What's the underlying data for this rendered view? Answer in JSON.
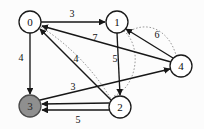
{
  "figure": {
    "type": "directed-weighted-graph",
    "background_color": "#fcfcfc",
    "node_fill_default": "#ffffff",
    "node_fill_highlight": "#8f8f8f",
    "edge_color": "#171717",
    "dotted_path_color": "#9a9a9a"
  },
  "nodes": [
    {
      "id": "0",
      "label": "0",
      "cx": 30,
      "cy": 22,
      "r": 11,
      "highlighted": false
    },
    {
      "id": "1",
      "label": "1",
      "cx": 117,
      "cy": 22,
      "r": 11,
      "highlighted": false
    },
    {
      "id": "4",
      "label": "4",
      "cx": 181,
      "cy": 66,
      "r": 11,
      "highlighted": false
    },
    {
      "id": "2",
      "label": "2",
      "cx": 120,
      "cy": 107,
      "r": 11,
      "highlighted": false
    },
    {
      "id": "3",
      "label": "3",
      "cx": 30,
      "cy": 106,
      "r": 11,
      "highlighted": true
    }
  ],
  "edges": [
    {
      "id": "e01",
      "from": "0",
      "to": "1",
      "weight": "3",
      "label_x": 72,
      "label_y": 13
    },
    {
      "id": "e40",
      "from": "4",
      "to": "0",
      "weight": "7",
      "label_x": 95,
      "label_y": 37
    },
    {
      "id": "e41",
      "from": "4",
      "to": "1",
      "weight": "6",
      "label_x": 157,
      "label_y": 34
    },
    {
      "id": "e12",
      "from": "1",
      "to": "2",
      "weight": "5",
      "label_x": 115,
      "label_y": 58
    },
    {
      "id": "e03",
      "from": "0",
      "to": "3",
      "weight": "4",
      "label_x": 21,
      "label_y": 57
    },
    {
      "id": "e20",
      "from": "2",
      "to": "0",
      "weight": "4",
      "label_x": 76,
      "label_y": 58
    },
    {
      "id": "e23",
      "from": "2",
      "to": "3",
      "weight": "3",
      "label_x": 73,
      "label_y": 86
    },
    {
      "id": "e25",
      "from": "2",
      "to": "3",
      "weight": "5",
      "label_x": 78,
      "label_y": 119
    },
    {
      "id": "e34",
      "from": "3",
      "to": "4",
      "weight": "",
      "label_x": 0,
      "label_y": 0
    }
  ],
  "weights_listed": [
    "3",
    "7",
    "6",
    "5",
    "4",
    "4",
    "3",
    "5"
  ],
  "node_labels_listed": [
    "0",
    "1",
    "2",
    "3",
    "4"
  ]
}
